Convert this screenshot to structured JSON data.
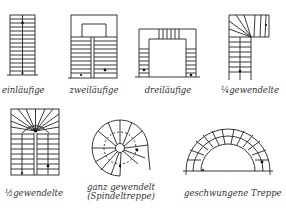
{
  "figure": {
    "type": "stair-types-diagram",
    "language": "German",
    "stroke_color": "#222222",
    "label_color": "#333333"
  },
  "stairs": [
    {
      "id": "einlaeufig",
      "label": "einläufige"
    },
    {
      "id": "zweilaeufig",
      "label": "zweiläufige"
    },
    {
      "id": "dreilaeufig",
      "label": "dreiläufige"
    },
    {
      "id": "viertelgewendelt",
      "label": "¼gewendelte"
    },
    {
      "id": "halbgewendelt",
      "label": "½gewendelte"
    },
    {
      "id": "spindel",
      "label_line1": "ganz gewendelt",
      "label_line2": "(Spindeltreppe)"
    },
    {
      "id": "geschwungen",
      "label": "geschwungene Treppe"
    }
  ]
}
